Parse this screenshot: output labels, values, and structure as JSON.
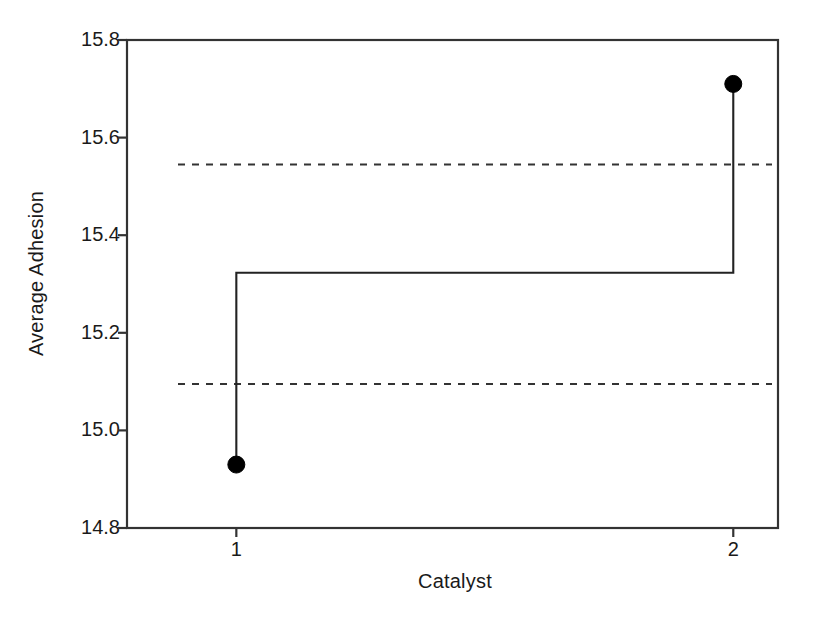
{
  "chart_data": {
    "type": "line",
    "title": "",
    "subtitle": "",
    "xlabel": "Catalyst",
    "ylabel": "Average Adhesion",
    "categories": [
      "1",
      "2"
    ],
    "x": [
      1,
      2
    ],
    "values": [
      14.93,
      15.71
    ],
    "series": [
      {
        "name": "Average Adhesion",
        "values": [
          14.93,
          15.71
        ]
      }
    ],
    "xlim": [
      0.78,
      2.09
    ],
    "ylim": [
      14.8,
      15.8
    ],
    "ytick_labels": [
      "15.8",
      "15.6",
      "15.4",
      "15.2",
      "15.0",
      "14.8"
    ],
    "ytick_values": [
      15.8,
      15.6,
      15.4,
      15.2,
      15.0,
      14.8
    ],
    "xtick_labels": [
      "1",
      "2"
    ],
    "xtick_values": [
      1,
      2
    ],
    "grid": false,
    "legend": null,
    "reference_lines": [
      {
        "name": "center-line",
        "value": 15.323,
        "style": "solid",
        "label": ""
      },
      {
        "name": "upper-decision-limit",
        "value": 15.545,
        "style": "dashed",
        "label": ""
      },
      {
        "name": "lower-decision-limit",
        "value": 15.095,
        "style": "dashed",
        "label": ""
      }
    ],
    "marker": "filled-circle",
    "line_style": "step",
    "colors": {
      "line": "#222222",
      "marker": "#000000",
      "reference_solid": "#222222",
      "reference_dashed": "#333333",
      "axis": "#333333",
      "background": "#ffffff"
    }
  },
  "axes": {
    "y_title": "Average Adhesion",
    "x_title": "Catalyst",
    "y_ticks": [
      {
        "label": "15.8",
        "value": 15.8
      },
      {
        "label": "15.6",
        "value": 15.6
      },
      {
        "label": "15.4",
        "value": 15.4
      },
      {
        "label": "15.2",
        "value": 15.2
      },
      {
        "label": "15.0",
        "value": 15.0
      },
      {
        "label": "14.8",
        "value": 14.8
      }
    ],
    "x_ticks": [
      {
        "label": "1",
        "value": 1
      },
      {
        "label": "2",
        "value": 2
      }
    ]
  }
}
